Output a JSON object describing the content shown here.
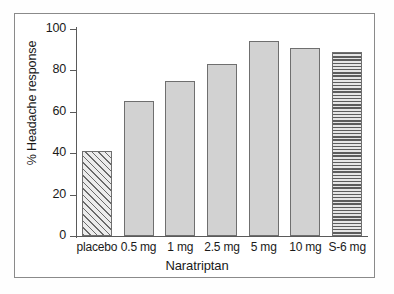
{
  "chart_data": {
    "type": "bar",
    "title": "",
    "xlabel": "Naratriptan",
    "ylabel": "% Headache response",
    "categories": [
      "placebo",
      "0.5 mg",
      "1 mg",
      "2.5 mg",
      "5 mg",
      "10 mg",
      "S-6 mg"
    ],
    "values": [
      41,
      65,
      75,
      83,
      94,
      91,
      89
    ],
    "bar_styles": [
      "diagonal-hatch",
      "solid",
      "solid",
      "solid",
      "solid",
      "solid",
      "horizontal-hatch"
    ],
    "ylim": [
      0,
      100
    ],
    "yticks": [
      0,
      20,
      40,
      60,
      80,
      100
    ],
    "ytick_labels": [
      "0",
      "20",
      "40",
      "60",
      "80",
      "100"
    ],
    "grid": false,
    "legend": false,
    "colors": {
      "bar_fill": "#d2d2d2",
      "bar_edge": "#6f6f6f",
      "axis": "#5a5a5a",
      "frame": "#8a8a8a",
      "background": "#ffffff",
      "text": "#1a1a1a"
    }
  }
}
